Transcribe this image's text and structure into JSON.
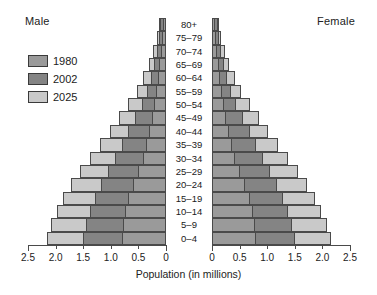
{
  "header": {
    "male_label": "Male",
    "female_label": "Female"
  },
  "legend": {
    "items": [
      {
        "label": "1980",
        "color": "#9a9a9a"
      },
      {
        "label": "2002",
        "color": "#848484"
      },
      {
        "label": "2025",
        "color": "#c9c9c9"
      }
    ]
  },
  "axis": {
    "title": "Population (in millions)",
    "tick_labels_left": [
      "2.5",
      "2.0",
      "1.5",
      "1.0",
      "0.5",
      "0"
    ],
    "tick_labels_right": [
      "0",
      "0.5",
      "1.0",
      "1.5",
      "2.0",
      "2.5"
    ]
  },
  "chart_data": {
    "type": "bar",
    "subtype": "population-pyramid",
    "title": "",
    "xlabel": "Population (in millions)",
    "ylabel": "",
    "xlim": [
      0,
      2.5
    ],
    "grid": false,
    "legend_position": "top-left",
    "axis_direction": "left-male-right-female",
    "categories": [
      "80+",
      "75–79",
      "70–74",
      "65–69",
      "60–64",
      "55–59",
      "50–54",
      "45–49",
      "40–44",
      "35–39",
      "30–34",
      "25–29",
      "20–24",
      "15–19",
      "10–14",
      "5–9",
      "0–4"
    ],
    "series": [
      {
        "name": "1980",
        "color": "#9a9a9a",
        "male": [
          0.06,
          0.07,
          0.09,
          0.12,
          0.15,
          0.18,
          0.21,
          0.25,
          0.3,
          0.36,
          0.42,
          0.5,
          0.6,
          0.68,
          0.75,
          0.78,
          0.8
        ],
        "female": [
          0.06,
          0.07,
          0.09,
          0.12,
          0.15,
          0.18,
          0.21,
          0.25,
          0.3,
          0.36,
          0.42,
          0.5,
          0.6,
          0.68,
          0.75,
          0.78,
          0.8
        ]
      },
      {
        "name": "2002",
        "color": "#848484",
        "male": [
          0.1,
          0.12,
          0.16,
          0.21,
          0.27,
          0.34,
          0.44,
          0.56,
          0.68,
          0.8,
          0.92,
          1.05,
          1.18,
          1.28,
          1.38,
          1.45,
          1.5
        ],
        "female": [
          0.1,
          0.12,
          0.16,
          0.21,
          0.27,
          0.34,
          0.44,
          0.56,
          0.68,
          0.8,
          0.92,
          1.05,
          1.18,
          1.28,
          1.38,
          1.45,
          1.5
        ]
      },
      {
        "name": "2025",
        "color": "#c9c9c9",
        "male": [
          0.13,
          0.17,
          0.23,
          0.31,
          0.41,
          0.53,
          0.68,
          0.85,
          1.02,
          1.2,
          1.38,
          1.55,
          1.72,
          1.86,
          1.98,
          2.08,
          2.15
        ],
        "female": [
          0.13,
          0.17,
          0.23,
          0.31,
          0.41,
          0.53,
          0.68,
          0.85,
          1.02,
          1.2,
          1.38,
          1.55,
          1.72,
          1.86,
          1.98,
          2.08,
          2.15
        ]
      }
    ]
  }
}
